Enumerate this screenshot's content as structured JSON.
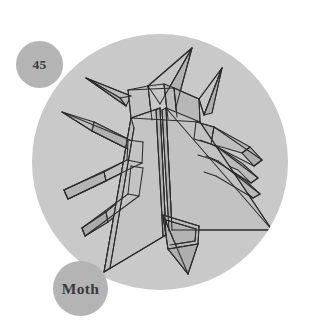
{
  "plate": {
    "number_badge": {
      "label": "45",
      "name": "plate-number-badge",
      "fill": "#b4b4b4",
      "text_color": "#3a3a3a"
    },
    "title_badge": {
      "label": "Moth",
      "name": "plate-title-badge",
      "fill": "#b4b4b4",
      "text_color": "#3a3a3a"
    },
    "background_color": "#ffffff",
    "disc": {
      "name": "plate-disc",
      "fill": "#c9c9c9",
      "center_x": 160,
      "center_y": 162,
      "radius": 128
    },
    "subject": {
      "name": "origami-moth",
      "description": "Origami moth folded model, top view",
      "line_color": "#2b2b2b",
      "face_light": "#c6c6c6",
      "face_mid": "#bdbdbd",
      "face_dark": "#b2b2b2",
      "face_darker": "#a8a8a8"
    }
  }
}
